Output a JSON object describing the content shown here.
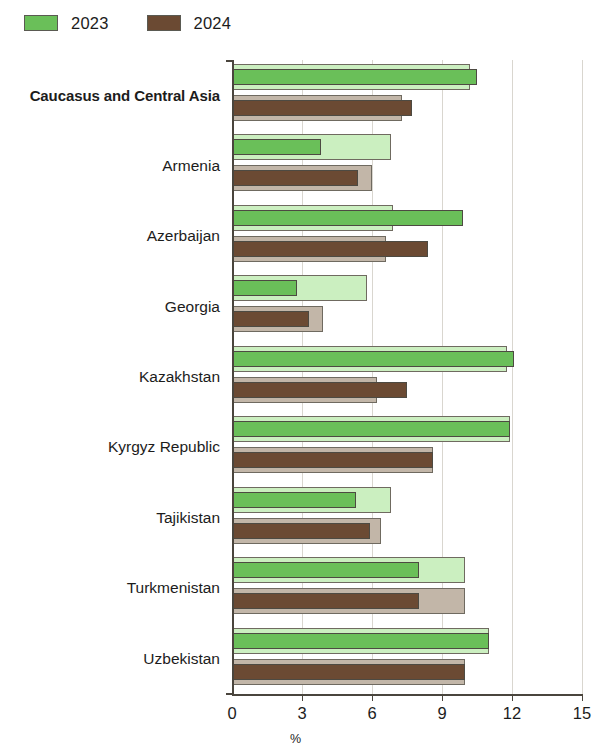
{
  "legend": {
    "entries": [
      {
        "label": "2023",
        "color": "#6ABF59",
        "key": "2023"
      },
      {
        "label": "2024",
        "color": "#6B4A33",
        "key": "2024"
      }
    ]
  },
  "axis": {
    "x_title": "%",
    "ticks": [
      "0",
      "3",
      "6",
      "9",
      "12",
      "15"
    ]
  },
  "chart_data": {
    "type": "bar",
    "orientation": "horizontal",
    "title": "",
    "subtitle": "",
    "xlabel": "%",
    "ylabel": "",
    "xlim": [
      0,
      15
    ],
    "xticks": [
      0,
      3,
      6,
      9,
      12,
      15
    ],
    "grid": "vertical",
    "legend_position": "top-left",
    "categories": [
      "Caucasus and Central Asia",
      "Armenia",
      "Azerbaijan",
      "Georgia",
      "Kazakhstan",
      "Kyrgyz Republic",
      "Tajikistan",
      "Turkmenistan",
      "Uzbekistan"
    ],
    "series": [
      {
        "name": "2023",
        "color": "#6ABF59",
        "backdrop_color": "#CBEFC0",
        "values": [
          10.5,
          3.8,
          9.9,
          2.8,
          12.1,
          11.9,
          5.3,
          8.0,
          11.0
        ],
        "backdrop_values": [
          10.2,
          6.8,
          6.9,
          5.8,
          11.8,
          11.9,
          6.8,
          10.0,
          11.0
        ]
      },
      {
        "name": "2024",
        "color": "#6B4A33",
        "backdrop_color": "#C2B6A8",
        "values": [
          7.7,
          5.4,
          8.4,
          3.3,
          7.5,
          8.6,
          5.9,
          8.0,
          10.0
        ],
        "backdrop_values": [
          7.3,
          6.0,
          6.6,
          3.9,
          6.2,
          8.6,
          6.4,
          10.0,
          10.0
        ]
      }
    ],
    "bold_categories": [
      "Caucasus and Central Asia"
    ]
  }
}
